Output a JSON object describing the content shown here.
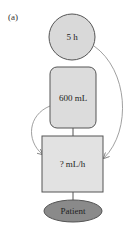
{
  "figure": {
    "panel_label": "(a)"
  },
  "nodes": {
    "duration": {
      "label": "5 h",
      "shape": "circle",
      "fill": "#d9d9d9"
    },
    "volume": {
      "label": "600 mL",
      "shape": "rounded-rect",
      "fill": "#dcdcdc"
    },
    "rate": {
      "label": "? mL/h",
      "shape": "square",
      "fill": "#e2e2e2"
    },
    "patient": {
      "label": "Patient",
      "shape": "ellipse",
      "fill": "#8a8a8a"
    }
  },
  "edges": [
    {
      "from": "duration",
      "to": "rate",
      "type": "curved-arrow"
    },
    {
      "from": "volume",
      "to": "rate",
      "type": "curved-arrow"
    },
    {
      "from": "volume",
      "to": "rate",
      "type": "line"
    },
    {
      "from": "rate",
      "to": "patient",
      "type": "line"
    }
  ],
  "colors": {
    "stroke": "#555555",
    "arrow": "#888888"
  }
}
